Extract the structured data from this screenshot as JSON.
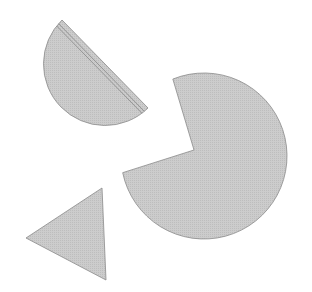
{
  "figure": {
    "width": 312,
    "height": 292,
    "background": "#ffffff",
    "fill_color": "#c9c9c9",
    "stroke_color": "#8a8a8a",
    "shapes": [
      {
        "type": "semicircle",
        "label": "half-disc with double parallel line",
        "chord_start": [
          62,
          20
        ],
        "chord_end": [
          148,
          108
        ],
        "bulge_side": "lower-left",
        "inner_lines": 2
      },
      {
        "type": "pacman",
        "label": "disc with wedge cut out",
        "center": [
          204,
          156
        ],
        "radius": 83,
        "notch_vertex": [
          194,
          150
        ],
        "cut_start": [
          172,
          77
        ],
        "cut_end": [
          126,
          172
        ]
      },
      {
        "type": "triangle",
        "label": "triangle pointing left",
        "vertices": [
          [
            102,
            188
          ],
          [
            26,
            238
          ],
          [
            106,
            280
          ]
        ]
      }
    ]
  }
}
